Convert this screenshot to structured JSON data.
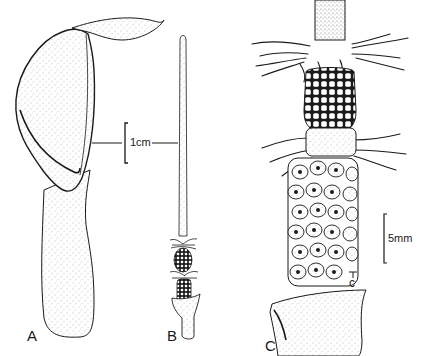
{
  "figure": {
    "panels": [
      {
        "id": "A",
        "label": "A",
        "subject": "spathe"
      },
      {
        "id": "B",
        "label": "B",
        "subject": "spadix"
      },
      {
        "id": "C",
        "label": "C",
        "subject": "spadix-detail"
      }
    ],
    "scale_bars": [
      {
        "label": "1cm",
        "applies_to": [
          "A",
          "B"
        ]
      },
      {
        "label": "5mm",
        "applies_to": [
          "C"
        ]
      }
    ],
    "annotations": [
      {
        "label": "c",
        "panel": "C"
      }
    ],
    "colors": {
      "ink": "#1a1a1a",
      "stipple": "#8a8a8a",
      "paper": "#ffffff"
    }
  }
}
